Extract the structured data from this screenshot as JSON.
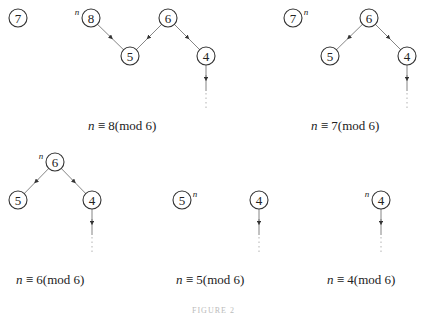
{
  "diagrams": [
    {
      "id": "a",
      "caption": "n ≡ 8(mod 6)",
      "nodes": [
        {
          "label": "7",
          "x": 18,
          "y": 18,
          "sup": ""
        },
        {
          "label": "8",
          "x": 91,
          "y": 18,
          "sup": "n",
          "sup_side": "left"
        },
        {
          "label": "5",
          "x": 130,
          "y": 56,
          "sup": ""
        },
        {
          "label": "6",
          "x": 168,
          "y": 18,
          "sup": ""
        },
        {
          "label": "4",
          "x": 206,
          "y": 56,
          "sup": ""
        }
      ],
      "edges": [
        [
          "8",
          "5"
        ],
        [
          "6",
          "5"
        ],
        [
          "6",
          "4"
        ]
      ],
      "tail_from": "4"
    },
    {
      "id": "b",
      "caption": "n ≡ 7(mod 6)",
      "nodes": [
        {
          "label": "7",
          "x": 293,
          "y": 18,
          "sup": "n",
          "sup_side": "right"
        },
        {
          "label": "6",
          "x": 369,
          "y": 18,
          "sup": ""
        },
        {
          "label": "5",
          "x": 330,
          "y": 56,
          "sup": ""
        },
        {
          "label": "4",
          "x": 407,
          "y": 56,
          "sup": ""
        }
      ],
      "edges": [
        [
          "6",
          "5"
        ],
        [
          "6",
          "4"
        ]
      ],
      "tail_from": "4"
    },
    {
      "id": "c",
      "caption": "n ≡ 6(mod 6)",
      "nodes": [
        {
          "label": "6",
          "x": 55,
          "y": 162,
          "sup": "n",
          "sup_side": "left"
        },
        {
          "label": "5",
          "x": 18,
          "y": 200,
          "sup": ""
        },
        {
          "label": "4",
          "x": 92,
          "y": 200,
          "sup": ""
        }
      ],
      "edges": [
        [
          "6",
          "5"
        ],
        [
          "6",
          "4"
        ]
      ],
      "tail_from": "4"
    },
    {
      "id": "d",
      "caption": "n ≡ 5(mod 6)",
      "nodes": [
        {
          "label": "5",
          "x": 182,
          "y": 200,
          "sup": "n",
          "sup_side": "right"
        },
        {
          "label": "4",
          "x": 259,
          "y": 200,
          "sup": ""
        }
      ],
      "edges": [],
      "tail_from": "4"
    },
    {
      "id": "e",
      "caption": "n ≡ 4(mod 6)",
      "nodes": [
        {
          "label": "4",
          "x": 381,
          "y": 200,
          "sup": "n",
          "sup_side": "left"
        }
      ],
      "edges": [],
      "tail_from": "4"
    }
  ],
  "captions": {
    "a": "≡ 8(mod 6)",
    "b": "≡ 7(mod 6)",
    "c": "≡ 6(mod 6)",
    "d": "≡ 5(mod 6)",
    "e": "≡ 4(mod 6)",
    "var": "n"
  },
  "figure_label": "FIGURE 2"
}
